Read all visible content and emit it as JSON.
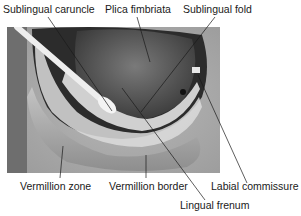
{
  "figure": {
    "labels": [
      {
        "id": "sublingual-caruncle",
        "text": "Sublingual caruncle"
      },
      {
        "id": "plica-fimbriata",
        "text": "Plica fimbriata"
      },
      {
        "id": "sublingual-fold",
        "text": "Sublingual fold"
      },
      {
        "id": "vermillion-zone",
        "text": "Vermillion zone"
      },
      {
        "id": "vermillion-border",
        "text": "Vermillion border"
      },
      {
        "id": "labial-commissure",
        "text": "Labial commissure"
      },
      {
        "id": "lingual-frenum",
        "text": "Lingual frenum"
      }
    ]
  }
}
